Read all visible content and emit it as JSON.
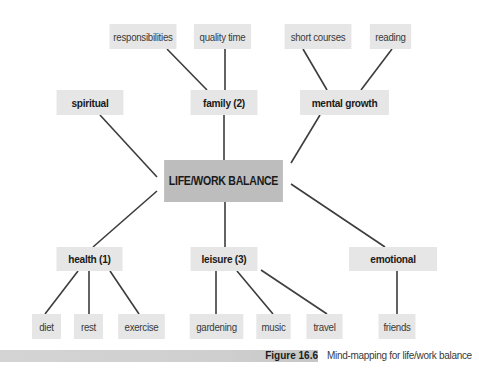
{
  "diagram": {
    "type": "mind-map",
    "center": {
      "label": "LIFE/WORK BALANCE",
      "x": 156,
      "y": 160,
      "w": 135,
      "h": 42
    },
    "branches": [
      {
        "id": "spiritual",
        "label": "spiritual",
        "x": 52,
        "y": 90,
        "w": 76,
        "h": 25,
        "children": []
      },
      {
        "id": "family",
        "label": "family (2)",
        "x": 186,
        "y": 90,
        "w": 76,
        "h": 25,
        "children": [
          {
            "id": "responsibilities",
            "label": "responsibilities",
            "x": 105,
            "y": 24,
            "w": 76,
            "h": 25
          },
          {
            "id": "quality-time",
            "label": "quality time",
            "x": 190,
            "y": 24,
            "w": 65,
            "h": 25
          }
        ]
      },
      {
        "id": "mental-growth",
        "label": "mental growth",
        "x": 294,
        "y": 90,
        "w": 101,
        "h": 25,
        "children": [
          {
            "id": "short-courses",
            "label": "short courses",
            "x": 280,
            "y": 24,
            "w": 76,
            "h": 25
          },
          {
            "id": "reading",
            "label": "reading",
            "x": 367,
            "y": 24,
            "w": 47,
            "h": 25
          }
        ]
      },
      {
        "id": "health",
        "label": "health (1)",
        "x": 52,
        "y": 247,
        "w": 75,
        "h": 24,
        "children": [
          {
            "id": "diet",
            "label": "diet",
            "x": 30,
            "y": 314,
            "w": 33,
            "h": 25
          },
          {
            "id": "rest",
            "label": "rest",
            "x": 72,
            "y": 314,
            "w": 33,
            "h": 25
          },
          {
            "id": "exercise",
            "label": "exercise",
            "x": 115,
            "y": 314,
            "w": 53,
            "h": 25
          }
        ]
      },
      {
        "id": "leisure",
        "label": "leisure (3)",
        "x": 186,
        "y": 247,
        "w": 76,
        "h": 24,
        "children": [
          {
            "id": "gardening",
            "label": "gardening",
            "x": 186,
            "y": 314,
            "w": 61,
            "h": 25
          },
          {
            "id": "music",
            "label": "music",
            "x": 254,
            "y": 314,
            "w": 39,
            "h": 25
          },
          {
            "id": "travel",
            "label": "travel",
            "x": 304,
            "y": 314,
            "w": 41,
            "h": 25
          }
        ]
      },
      {
        "id": "emotional",
        "label": "emotional",
        "x": 343,
        "y": 247,
        "w": 100,
        "h": 24,
        "children": [
          {
            "id": "friends",
            "label": "friends",
            "x": 376,
            "y": 314,
            "w": 42,
            "h": 25
          }
        ]
      }
    ],
    "edges": [
      {
        "from": "center",
        "to": "spiritual",
        "x1": 157,
        "y1": 177,
        "x2": 100,
        "y2": 115
      },
      {
        "from": "center",
        "to": "family",
        "x1": 224,
        "y1": 160,
        "x2": 224,
        "y2": 115
      },
      {
        "from": "center",
        "to": "mental-growth",
        "x1": 291,
        "y1": 163,
        "x2": 320,
        "y2": 115
      },
      {
        "from": "center",
        "to": "health",
        "x1": 157,
        "y1": 191,
        "x2": 93,
        "y2": 247
      },
      {
        "from": "center",
        "to": "leisure",
        "x1": 225,
        "y1": 202,
        "x2": 225,
        "y2": 247
      },
      {
        "from": "center",
        "to": "emotional",
        "x1": 291,
        "y1": 184,
        "x2": 385,
        "y2": 247
      },
      {
        "from": "family",
        "to": "responsibilities",
        "x1": 207,
        "y1": 90,
        "x2": 167,
        "y2": 49
      },
      {
        "from": "family",
        "to": "quality-time",
        "x1": 225,
        "y1": 90,
        "x2": 225,
        "y2": 49
      },
      {
        "from": "mental-growth",
        "to": "short-courses",
        "x1": 327,
        "y1": 90,
        "x2": 303,
        "y2": 49
      },
      {
        "from": "mental-growth",
        "to": "reading",
        "x1": 361,
        "y1": 90,
        "x2": 392,
        "y2": 49
      },
      {
        "from": "health",
        "to": "diet",
        "x1": 78,
        "y1": 271,
        "x2": 45,
        "y2": 314
      },
      {
        "from": "health",
        "to": "rest",
        "x1": 89,
        "y1": 271,
        "x2": 89,
        "y2": 314
      },
      {
        "from": "health",
        "to": "exercise",
        "x1": 110,
        "y1": 271,
        "x2": 139,
        "y2": 314
      },
      {
        "from": "leisure",
        "to": "gardening",
        "x1": 216,
        "y1": 271,
        "x2": 216,
        "y2": 314
      },
      {
        "from": "leisure",
        "to": "music",
        "x1": 237,
        "y1": 271,
        "x2": 273,
        "y2": 314
      },
      {
        "from": "leisure",
        "to": "travel",
        "x1": 261,
        "y1": 270,
        "x2": 327,
        "y2": 314
      },
      {
        "from": "emotional",
        "to": "friends",
        "x1": 397,
        "y1": 271,
        "x2": 397,
        "y2": 314
      }
    ]
  },
  "caption": {
    "figure_label": "Figure 16.6",
    "text": "Mind-mapping for life/work balance"
  },
  "colors": {
    "node_bg": "#e6e6e6",
    "center_bg": "#bdbdbd",
    "line": "#3c3c3c",
    "caption_bar": "#d2d2d2"
  }
}
